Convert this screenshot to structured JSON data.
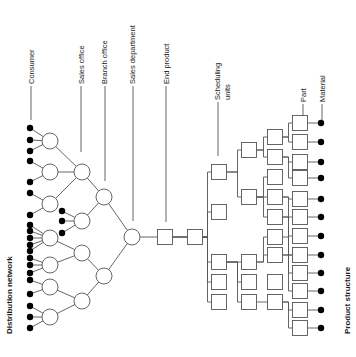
{
  "diagram": {
    "title_left": "Distribution network",
    "title_right": "Product structure",
    "labels": [
      {
        "text": "Consumer",
        "x": 31,
        "y": 84
      },
      {
        "text": "Sales office",
        "x": 81,
        "y": 84
      },
      {
        "text": "Branch office",
        "x": 104,
        "y": 84
      },
      {
        "text": "Sales department",
        "x": 132,
        "y": 84
      },
      {
        "text": "End product",
        "x": 166,
        "y": 84
      },
      {
        "text": "Scheduling",
        "x": 217,
        "y": 100
      },
      {
        "text": "units",
        "x": 227,
        "y": 100
      },
      {
        "text": "Part",
        "x": 303,
        "y": 102
      },
      {
        "text": "Material",
        "x": 322,
        "y": 102
      }
    ],
    "label_lines": [
      {
        "x": 31,
        "y1": 86,
        "y2": 120
      },
      {
        "x": 81,
        "y1": 86,
        "y2": 152
      },
      {
        "x": 105,
        "y1": 86,
        "y2": 181
      },
      {
        "x": 133,
        "y1": 86,
        "y2": 221
      },
      {
        "x": 166,
        "y1": 86,
        "y2": 222
      },
      {
        "x": 218,
        "y1": 102,
        "y2": 156
      },
      {
        "x": 303,
        "y1": 104,
        "y2": 120
      },
      {
        "x": 322,
        "y1": 104,
        "y2": 120
      }
    ],
    "dist_circles": [
      {
        "id": "c1",
        "x": 50,
        "y": 141
      },
      {
        "id": "c2",
        "x": 50,
        "y": 172
      },
      {
        "id": "c3",
        "x": 50,
        "y": 204
      },
      {
        "id": "c4",
        "x": 50,
        "y": 238
      },
      {
        "id": "c5",
        "x": 50,
        "y": 265
      },
      {
        "id": "c6",
        "x": 50,
        "y": 287
      },
      {
        "id": "c7",
        "x": 50,
        "y": 317
      },
      {
        "id": "so1",
        "x": 82,
        "y": 172
      },
      {
        "id": "so2",
        "x": 82,
        "y": 221
      },
      {
        "id": "so3",
        "x": 82,
        "y": 253
      },
      {
        "id": "so4",
        "x": 82,
        "y": 301
      },
      {
        "id": "bo1",
        "x": 104,
        "y": 197
      },
      {
        "id": "bo2",
        "x": 104,
        "y": 276
      },
      {
        "id": "sd",
        "x": 132,
        "y": 237
      }
    ],
    "dist_edges": [
      [
        "c1",
        "so1"
      ],
      [
        "c2",
        "so1"
      ],
      [
        "c3",
        "so1"
      ],
      [
        "c4",
        "so3"
      ],
      [
        "c5",
        "so3"
      ],
      [
        "c6",
        "so4"
      ],
      [
        "c7",
        "so4"
      ],
      [
        "so1",
        "bo1"
      ],
      [
        "so2",
        "bo1"
      ],
      [
        "so3",
        "bo2"
      ],
      [
        "so4",
        "bo2"
      ],
      [
        "bo1",
        "sd"
      ],
      [
        "bo2",
        "sd"
      ]
    ],
    "consumer_dots": [
      {
        "x": 30,
        "y": 128,
        "to": "c1"
      },
      {
        "x": 30,
        "y": 140,
        "to": "c1"
      },
      {
        "x": 30,
        "y": 151,
        "to": "c1"
      },
      {
        "x": 30,
        "y": 161,
        "to": "c2"
      },
      {
        "x": 30,
        "y": 182,
        "to": "c2"
      },
      {
        "x": 30,
        "y": 193,
        "to": "c3"
      },
      {
        "x": 30,
        "y": 215,
        "to": "c3"
      },
      {
        "x": 30,
        "y": 225,
        "to": "c4"
      },
      {
        "x": 30,
        "y": 231,
        "to": "c4"
      },
      {
        "x": 30,
        "y": 238,
        "to": "c4"
      },
      {
        "x": 30,
        "y": 245,
        "to": "c4"
      },
      {
        "x": 30,
        "y": 251,
        "to": "c4"
      },
      {
        "x": 30,
        "y": 258,
        "to": "c5"
      },
      {
        "x": 30,
        "y": 265,
        "to": "c5"
      },
      {
        "x": 30,
        "y": 273,
        "to": "c5"
      },
      {
        "x": 30,
        "y": 280,
        "to": "c6"
      },
      {
        "x": 30,
        "y": 294,
        "to": "c6"
      },
      {
        "x": 30,
        "y": 306,
        "to": "c7"
      },
      {
        "x": 30,
        "y": 317,
        "to": "c7"
      },
      {
        "x": 30,
        "y": 328,
        "to": "c7"
      },
      {
        "x": 62,
        "y": 211,
        "to": "so2"
      },
      {
        "x": 62,
        "y": 221,
        "to": "so2"
      },
      {
        "x": 62,
        "y": 233,
        "to": "so2"
      }
    ],
    "boxes": [
      {
        "id": "ep",
        "x": 165,
        "y": 237
      },
      {
        "id": "s1",
        "x": 195,
        "y": 237
      },
      {
        "id": "a1",
        "x": 219,
        "y": 172
      },
      {
        "id": "a2",
        "x": 219,
        "y": 212
      },
      {
        "id": "a3",
        "x": 219,
        "y": 262
      },
      {
        "id": "a4",
        "x": 219,
        "y": 282
      },
      {
        "id": "a5",
        "x": 219,
        "y": 302
      },
      {
        "id": "b1",
        "x": 249,
        "y": 150
      },
      {
        "id": "b2",
        "x": 249,
        "y": 197
      },
      {
        "id": "b3",
        "x": 249,
        "y": 262
      },
      {
        "id": "b4",
        "x": 249,
        "y": 282
      },
      {
        "id": "b5",
        "x": 249,
        "y": 302
      },
      {
        "id": "d1",
        "x": 275,
        "y": 137
      },
      {
        "id": "d2",
        "x": 275,
        "y": 157
      },
      {
        "id": "d3",
        "x": 275,
        "y": 177
      },
      {
        "id": "d4",
        "x": 275,
        "y": 197
      },
      {
        "id": "d5",
        "x": 275,
        "y": 217
      },
      {
        "id": "d6",
        "x": 275,
        "y": 237
      },
      {
        "id": "d7",
        "x": 275,
        "y": 255
      },
      {
        "id": "d8",
        "x": 275,
        "y": 282
      },
      {
        "id": "d9",
        "x": 275,
        "y": 302
      },
      {
        "id": "p1",
        "x": 300,
        "y": 123
      },
      {
        "id": "p2",
        "x": 300,
        "y": 142
      },
      {
        "id": "p3",
        "x": 300,
        "y": 162
      },
      {
        "id": "p4",
        "x": 300,
        "y": 178
      },
      {
        "id": "p5",
        "x": 300,
        "y": 199
      },
      {
        "id": "p6",
        "x": 300,
        "y": 217
      },
      {
        "id": "p7",
        "x": 300,
        "y": 236
      },
      {
        "id": "p8",
        "x": 300,
        "y": 255
      },
      {
        "id": "p9",
        "x": 300,
        "y": 273
      },
      {
        "id": "p10",
        "x": 300,
        "y": 291
      },
      {
        "id": "p11",
        "x": 300,
        "y": 310
      },
      {
        "id": "p12",
        "x": 300,
        "y": 328
      }
    ],
    "tree_edges": [
      [
        "sd",
        "ep"
      ],
      [
        "ep",
        "s1"
      ],
      [
        "s1",
        "a1"
      ],
      [
        "s1",
        "a2"
      ],
      [
        "s1",
        "a3"
      ],
      [
        "ep",
        "a4"
      ],
      [
        "ep",
        "a5"
      ],
      [
        "a1",
        "b1"
      ],
      [
        "a1",
        "b2"
      ],
      [
        "a3",
        "b3"
      ],
      [
        "a3",
        "b4"
      ],
      [
        "a3",
        "b5"
      ],
      [
        "b1",
        "d1"
      ],
      [
        "b1",
        "d2"
      ],
      [
        "b2",
        "d3"
      ],
      [
        "b2",
        "d4"
      ],
      [
        "b2",
        "d5"
      ],
      [
        "b3",
        "d6"
      ],
      [
        "b3",
        "d7"
      ],
      [
        "b5",
        "d9"
      ],
      [
        "d1",
        "p1"
      ],
      [
        "d1",
        "p2"
      ],
      [
        "d2",
        "p3"
      ],
      [
        "d2",
        "p4"
      ],
      [
        "d4",
        "p5"
      ],
      [
        "d4",
        "p6"
      ],
      [
        "d5",
        "p7"
      ],
      [
        "d5",
        "p8"
      ],
      [
        "d6",
        "p8"
      ],
      [
        "d7",
        "p9"
      ],
      [
        "d7",
        "p10"
      ],
      [
        "d9",
        "p11"
      ],
      [
        "d9",
        "p12"
      ]
    ],
    "material_dots": [
      {
        "x": 321,
        "y": 123
      },
      {
        "x": 321,
        "y": 142
      },
      {
        "x": 321,
        "y": 162
      },
      {
        "x": 321,
        "y": 178
      },
      {
        "x": 321,
        "y": 199
      },
      {
        "x": 321,
        "y": 217
      },
      {
        "x": 321,
        "y": 236
      },
      {
        "x": 321,
        "y": 255
      },
      {
        "x": 321,
        "y": 273
      },
      {
        "x": 321,
        "y": 291
      },
      {
        "x": 321,
        "y": 310
      },
      {
        "x": 321,
        "y": 328
      }
    ]
  }
}
